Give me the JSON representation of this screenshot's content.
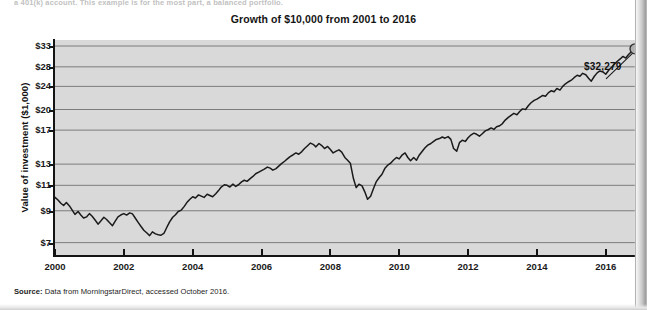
{
  "page": {
    "body_text_fragment": "a 401(k) account. This example is for the most part, a balanced portfolio.",
    "source_label": "Source:",
    "source_text": " Data from MorningstarDirect, accessed October 2016."
  },
  "chart_data": {
    "type": "line",
    "title": "Growth of $10,000 from 2001 to 2016",
    "xlabel": "",
    "ylabel": "Value of investment ($1,000)",
    "scale": "log",
    "grid": true,
    "legend": false,
    "xlim": [
      2000.0,
      2016.85
    ],
    "ylim": [
      6.3,
      34.6
    ],
    "xticks": [
      2000,
      2002,
      2004,
      2006,
      2008,
      2010,
      2012,
      2014,
      2016
    ],
    "xtick_labels": [
      "2000",
      "2002",
      "2004",
      "2006",
      "2008",
      "2010",
      "2012",
      "2014",
      "2016"
    ],
    "yticks": [
      7,
      9,
      11,
      13,
      17,
      20,
      24,
      28,
      33
    ],
    "ytick_labels": [
      "$7",
      "$9",
      "$11",
      "$13",
      "$17",
      "$20",
      "$24",
      "$28",
      "$33"
    ],
    "annotations": [
      {
        "name": "end-value-callout",
        "text": "$32,279",
        "x": 2016.85,
        "y": 32.279
      }
    ],
    "end_marker": {
      "x": 2016.85,
      "y": 32.279,
      "fill": "#b0b0b0",
      "stroke": "#2b2b2b"
    },
    "series": [
      {
        "name": "Value of investment",
        "color": "#1a1a1a",
        "x": [
          2000.0,
          2000.08,
          2000.17,
          2000.25,
          2000.33,
          2000.42,
          2000.5,
          2000.58,
          2000.67,
          2000.75,
          2000.83,
          2000.92,
          2001.0,
          2001.08,
          2001.17,
          2001.25,
          2001.33,
          2001.42,
          2001.5,
          2001.58,
          2001.67,
          2001.75,
          2001.83,
          2001.92,
          2002.0,
          2002.08,
          2002.17,
          2002.25,
          2002.33,
          2002.42,
          2002.5,
          2002.58,
          2002.67,
          2002.75,
          2002.83,
          2002.92,
          2003.0,
          2003.08,
          2003.17,
          2003.25,
          2003.33,
          2003.42,
          2003.5,
          2003.58,
          2003.67,
          2003.75,
          2003.83,
          2003.92,
          2004.0,
          2004.08,
          2004.17,
          2004.25,
          2004.33,
          2004.42,
          2004.5,
          2004.58,
          2004.67,
          2004.75,
          2004.83,
          2004.92,
          2005.0,
          2005.08,
          2005.17,
          2005.25,
          2005.33,
          2005.42,
          2005.5,
          2005.58,
          2005.67,
          2005.75,
          2005.83,
          2005.92,
          2006.0,
          2006.08,
          2006.17,
          2006.25,
          2006.33,
          2006.42,
          2006.5,
          2006.58,
          2006.67,
          2006.75,
          2006.83,
          2006.92,
          2007.0,
          2007.08,
          2007.17,
          2007.25,
          2007.33,
          2007.42,
          2007.5,
          2007.58,
          2007.67,
          2007.75,
          2007.83,
          2007.92,
          2008.0,
          2008.08,
          2008.17,
          2008.25,
          2008.33,
          2008.42,
          2008.5,
          2008.58,
          2008.67,
          2008.75,
          2008.83,
          2008.92,
          2009.0,
          2009.08,
          2009.17,
          2009.25,
          2009.33,
          2009.42,
          2009.5,
          2009.58,
          2009.67,
          2009.75,
          2009.83,
          2009.92,
          2010.0,
          2010.08,
          2010.17,
          2010.25,
          2010.33,
          2010.42,
          2010.5,
          2010.58,
          2010.67,
          2010.75,
          2010.83,
          2010.92,
          2011.0,
          2011.08,
          2011.17,
          2011.25,
          2011.33,
          2011.42,
          2011.5,
          2011.58,
          2011.67,
          2011.75,
          2011.83,
          2011.92,
          2012.0,
          2012.08,
          2012.17,
          2012.25,
          2012.33,
          2012.42,
          2012.5,
          2012.58,
          2012.67,
          2012.75,
          2012.83,
          2012.92,
          2013.0,
          2013.08,
          2013.17,
          2013.25,
          2013.33,
          2013.42,
          2013.5,
          2013.58,
          2013.67,
          2013.75,
          2013.83,
          2013.92,
          2014.0,
          2014.08,
          2014.17,
          2014.25,
          2014.33,
          2014.42,
          2014.5,
          2014.58,
          2014.67,
          2014.75,
          2014.83,
          2014.92,
          2015.0,
          2015.08,
          2015.17,
          2015.25,
          2015.33,
          2015.42,
          2015.5,
          2015.58,
          2015.67,
          2015.75,
          2015.83,
          2015.92,
          2016.0,
          2016.08,
          2016.17,
          2016.25,
          2016.33,
          2016.42,
          2016.5,
          2016.58,
          2016.67,
          2016.75,
          2016.85
        ],
        "y": [
          10.0,
          9.82,
          9.55,
          9.38,
          9.6,
          9.35,
          9.05,
          8.75,
          8.95,
          8.7,
          8.5,
          8.58,
          8.8,
          8.62,
          8.35,
          8.1,
          8.3,
          8.55,
          8.4,
          8.2,
          8.0,
          8.3,
          8.58,
          8.72,
          8.8,
          8.7,
          8.85,
          8.78,
          8.5,
          8.2,
          7.95,
          7.72,
          7.55,
          7.4,
          7.62,
          7.5,
          7.45,
          7.42,
          7.55,
          7.9,
          8.25,
          8.55,
          8.72,
          8.95,
          9.05,
          9.3,
          9.6,
          9.85,
          10.05,
          9.95,
          10.2,
          10.1,
          10.0,
          10.25,
          10.15,
          10.05,
          10.3,
          10.55,
          10.85,
          11.05,
          11.0,
          10.85,
          11.1,
          10.9,
          11.05,
          11.3,
          11.45,
          11.35,
          11.6,
          11.8,
          12.05,
          12.2,
          12.35,
          12.5,
          12.7,
          12.6,
          12.4,
          12.55,
          12.8,
          13.05,
          13.3,
          13.55,
          13.8,
          14.0,
          14.2,
          14.05,
          14.35,
          14.7,
          15.0,
          15.35,
          15.2,
          14.9,
          15.3,
          15.05,
          14.7,
          14.95,
          14.6,
          14.2,
          14.4,
          14.55,
          14.3,
          13.7,
          13.4,
          13.1,
          11.6,
          10.8,
          11.1,
          10.95,
          10.45,
          9.85,
          10.1,
          10.7,
          11.3,
          11.7,
          12.0,
          12.55,
          12.9,
          13.1,
          13.4,
          13.7,
          13.55,
          13.95,
          14.2,
          13.7,
          13.35,
          13.7,
          13.4,
          13.95,
          14.4,
          14.8,
          15.1,
          15.3,
          15.55,
          15.8,
          15.9,
          16.1,
          15.95,
          16.15,
          15.8,
          14.7,
          14.4,
          15.4,
          15.7,
          15.55,
          16.0,
          16.35,
          16.6,
          16.45,
          16.2,
          16.55,
          16.9,
          17.05,
          17.3,
          17.1,
          17.45,
          17.6,
          17.9,
          18.4,
          18.8,
          19.1,
          19.4,
          19.2,
          19.7,
          20.1,
          20.0,
          20.6,
          21.1,
          21.5,
          21.7,
          22.0,
          22.35,
          22.2,
          22.8,
          23.2,
          23.0,
          23.6,
          23.3,
          24.0,
          24.5,
          24.9,
          25.2,
          25.7,
          26.2,
          26.0,
          26.6,
          26.3,
          25.6,
          25.0,
          26.0,
          26.7,
          27.1,
          26.9,
          26.4,
          27.2,
          27.9,
          28.6,
          29.2,
          29.8,
          30.4,
          30.0,
          30.9,
          31.6,
          32.279
        ]
      }
    ]
  }
}
